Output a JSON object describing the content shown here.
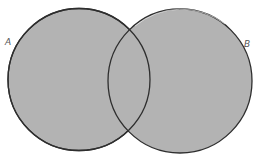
{
  "diagram": {
    "type": "venn",
    "sets": [
      {
        "label": "A",
        "cx": 79,
        "cy": 79.5,
        "r": 71,
        "fill": "#b3b3b3",
        "stroke": "#2e2e2e"
      },
      {
        "label": "B",
        "cx": 180,
        "cy": 81,
        "r": 72,
        "fill": "#b3b3b3",
        "stroke": "#2e2e2e"
      }
    ],
    "labels": {
      "a": "A",
      "b": "B"
    }
  }
}
